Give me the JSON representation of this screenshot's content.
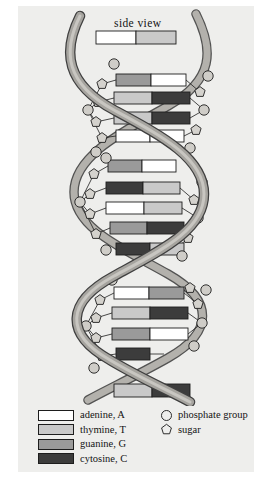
{
  "figure": {
    "view_label": "side view",
    "background": "#eeeeec"
  },
  "colors": {
    "adenine": "#ffffff",
    "thymine": "#c9c9c9",
    "guanine": "#9a9a9a",
    "cytosine": "#3c3c3c",
    "backbone_fill": "#a6a49f",
    "backbone_stroke": "#4a4a4a",
    "outline": "#1d1d1d",
    "sugar_fill": "#d4d2cd",
    "phosphate_fill": "#cfcdc8"
  },
  "legend": {
    "bases": [
      {
        "swatch": "adenine",
        "label": "adenine, A"
      },
      {
        "swatch": "thymine",
        "label": "thymine, T"
      },
      {
        "swatch": "guanine",
        "label": "guanine, G"
      },
      {
        "swatch": "cytosine",
        "label": "cytosine, C"
      }
    ],
    "parts": [
      {
        "icon": "circle-icon",
        "label": "phosphate group"
      },
      {
        "icon": "pentagon-icon",
        "label": "sugar"
      }
    ]
  },
  "helix": {
    "turns": 3,
    "base_pairs": [
      {
        "turn": "top-edge",
        "y": 30,
        "left": "adenine",
        "right": "thymine"
      },
      {
        "turn": 1,
        "y": 74,
        "left": "guanine",
        "right": "adenine"
      },
      {
        "turn": 1,
        "y": 92,
        "left": "thymine",
        "right": "cytosine"
      },
      {
        "turn": 1,
        "y": 110,
        "left": "thymine",
        "right": "cytosine"
      },
      {
        "turn": 1,
        "y": 128,
        "left": "adenine",
        "right": "adenine"
      },
      {
        "turn": 2,
        "y": 160,
        "left": "guanine",
        "right": "adenine"
      },
      {
        "turn": 2,
        "y": 182,
        "left": "cytosine",
        "right": "thymine"
      },
      {
        "turn": 2,
        "y": 202,
        "left": "adenine",
        "right": "thymine"
      },
      {
        "turn": 2,
        "y": 222,
        "left": "guanine",
        "right": "cytosine"
      },
      {
        "turn": 2,
        "y": 243,
        "left": "cytosine",
        "right": "thymine"
      },
      {
        "turn": 3,
        "y": 287,
        "left": "adenine",
        "right": "thymine"
      },
      {
        "turn": 3,
        "y": 307,
        "left": "thymine",
        "right": "cytosine"
      },
      {
        "turn": 3,
        "y": 328,
        "left": "guanine",
        "right": "adenine"
      },
      {
        "turn": 3,
        "y": 348,
        "left": "cytosine",
        "right": "cytosine"
      },
      {
        "turn": "bottom-edge",
        "y": 382,
        "left": "thymine",
        "right": "cytosine"
      }
    ]
  }
}
